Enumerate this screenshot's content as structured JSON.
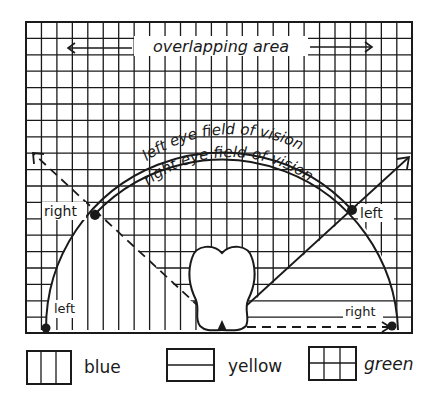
{
  "diagram": {
    "top_label": "overlapping area",
    "arc_label_outer": "left eye field of vision",
    "arc_label_inner": "right eye field of vision",
    "point_labels": {
      "upper_left": "right",
      "upper_right": "left",
      "lower_left": "left",
      "lower_right": "right"
    }
  },
  "legend": {
    "items": [
      {
        "pattern": "vertical-lines",
        "label": "blue"
      },
      {
        "pattern": "horizontal-lines",
        "label": "yellow"
      },
      {
        "pattern": "grid-lines",
        "label": "green"
      }
    ]
  },
  "colors": {
    "ink": "#1a1a1a",
    "background": "#ffffff"
  }
}
